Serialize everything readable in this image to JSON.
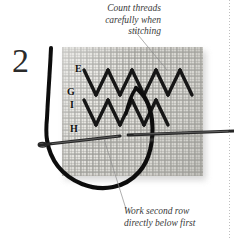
{
  "figure": {
    "step_number": "2"
  },
  "captions": {
    "top": {
      "lines": [
        "Count threads",
        "carefully when",
        "stitching"
      ]
    },
    "bottom": {
      "lines": [
        "Work second row",
        "directly below first"
      ]
    }
  },
  "point_labels": [
    {
      "id": "label-e",
      "text": "E",
      "x": 75,
      "y": 69
    },
    {
      "id": "label-g",
      "text": "G",
      "x": 67,
      "y": 92
    },
    {
      "id": "label-i",
      "text": "I",
      "x": 69,
      "y": 105
    },
    {
      "id": "label-h",
      "text": "H",
      "x": 71,
      "y": 129
    }
  ],
  "colors": {
    "background": "#ffffff",
    "fabric": "#e3e2dd",
    "fabric_grid": "#969691",
    "thread": "#111111",
    "needle": "#2a2a2a",
    "caption_text": "#3a3a3a",
    "leader_line": "#8d8d8d",
    "step_number": "#2b2b2b"
  },
  "geometry": {
    "fabric": {
      "x": 62,
      "y": 47,
      "width": 141,
      "height": 129
    },
    "page_rule_x": 229
  }
}
